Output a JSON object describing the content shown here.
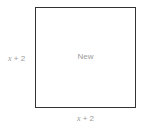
{
  "diagram": {
    "shape": "square",
    "center_label": "New",
    "left_side_label": {
      "variable": "x",
      "rest": " + 2"
    },
    "bottom_side_label": {
      "variable": "x",
      "rest": " + 2"
    },
    "colors": {
      "border": "#333333",
      "label": "#9a9a9a"
    }
  }
}
